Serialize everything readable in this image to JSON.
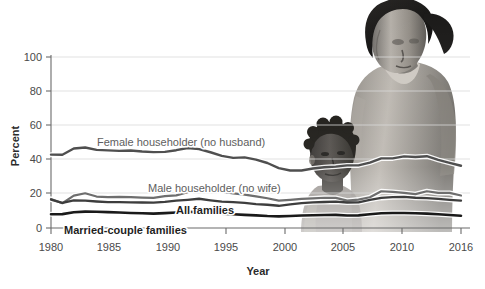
{
  "figure": {
    "background_color": "#ffffff",
    "photo": {
      "description": "grayscale photograph of a woman standing behind a child",
      "alt_name": "family-photograph"
    }
  },
  "chart_data": {
    "type": "line",
    "title": "",
    "xlabel": "Year",
    "ylabel": "Percent",
    "xlim": [
      1980,
      2016
    ],
    "ylim": [
      0,
      100
    ],
    "grid": true,
    "legend_position": "inline-labels",
    "xticks": [
      1980,
      1985,
      1990,
      1995,
      2000,
      2005,
      2010,
      2016
    ],
    "xtick_labels": [
      "1980",
      "1985",
      "1990",
      "1995",
      "2000",
      "2005",
      "2010",
      "2016"
    ],
    "yticks": [
      0,
      20,
      40,
      60,
      80,
      100
    ],
    "ytick_labels": [
      "0",
      "20",
      "40",
      "60",
      "80",
      "100"
    ],
    "x": [
      1980,
      1981,
      1982,
      1983,
      1984,
      1985,
      1986,
      1987,
      1988,
      1989,
      1990,
      1991,
      1992,
      1993,
      1994,
      1995,
      1996,
      1997,
      1998,
      1999,
      2000,
      2001,
      2002,
      2003,
      2004,
      2005,
      2006,
      2007,
      2008,
      2009,
      2010,
      2011,
      2012,
      2013,
      2014,
      2015,
      2016
    ],
    "series": [
      {
        "name": "Female householder (no husband)",
        "color": "#4f4f4f",
        "width": 2.4,
        "label_color": "#5e5e5e",
        "label_bold": false,
        "values": [
          42.9,
          42.8,
          46.5,
          47.1,
          45.7,
          45.4,
          45.1,
          45.3,
          44.7,
          44.4,
          44.5,
          45.5,
          46.8,
          46.1,
          44.3,
          42.2,
          41.0,
          41.3,
          40.0,
          38.0,
          35.0,
          33.6,
          33.6,
          34.8,
          35.5,
          35.9,
          36.6,
          36.6,
          38.2,
          40.7,
          40.7,
          41.9,
          41.5,
          42.0,
          39.8,
          38.1,
          36.4
        ]
      },
      {
        "name": "Male householder (no wife)",
        "color": "#6e6e6e",
        "width": 2.2,
        "label_color": "#6e6e6e",
        "label_bold": false,
        "values": [
          17.0,
          14.5,
          18.9,
          20.3,
          18.4,
          18.0,
          18.2,
          18.0,
          17.8,
          17.6,
          18.6,
          19.1,
          20.9,
          22.6,
          22.1,
          21.2,
          20.3,
          19.5,
          18.5,
          17.4,
          16.0,
          16.5,
          17.0,
          17.3,
          17.7,
          17.6,
          16.0,
          16.6,
          18.0,
          21.5,
          21.1,
          20.5,
          19.8,
          21.5,
          20.5,
          20.5,
          19.0
        ]
      },
      {
        "name": "All families",
        "color": "#3d3d3d",
        "width": 2.3,
        "label_color": "#1f1f1f",
        "label_bold": true,
        "values": [
          16.6,
          14.7,
          16.1,
          16.0,
          15.5,
          15.1,
          15.1,
          15.0,
          14.9,
          14.8,
          15.3,
          16.0,
          16.5,
          17.1,
          16.2,
          15.4,
          15.1,
          14.7,
          14.0,
          13.6,
          13.0,
          13.8,
          14.5,
          15.0,
          15.2,
          15.4,
          14.9,
          15.0,
          16.5,
          17.6,
          18.0,
          18.2,
          17.7,
          17.5,
          17.0,
          16.5,
          16.0
        ]
      },
      {
        "name": "Married-couple families",
        "color": "#1a1a1a",
        "width": 2.6,
        "label_color": "#1f1f1f",
        "label_bold": true,
        "values": [
          8.0,
          8.1,
          9.2,
          9.6,
          9.5,
          9.3,
          9.1,
          8.8,
          8.6,
          8.4,
          8.7,
          9.1,
          9.4,
          9.6,
          9.1,
          8.4,
          8.0,
          7.7,
          7.4,
          7.0,
          6.8,
          7.0,
          7.3,
          7.5,
          7.6,
          7.7,
          7.3,
          7.4,
          8.0,
          8.6,
          8.8,
          8.8,
          8.6,
          8.4,
          8.0,
          7.6,
          7.2
        ]
      }
    ],
    "annotations": [
      {
        "text": "Female householder (no husband)",
        "x_px": 97,
        "y_px": 146,
        "bold": false,
        "color": "#5e5e5e"
      },
      {
        "text": "Male householder (no wife)",
        "x_px": 148,
        "y_px": 192,
        "bold": false,
        "color": "#6e6e6e"
      },
      {
        "text": "All families",
        "x_px": 176,
        "y_px": 214,
        "bold": true,
        "color": "#1f1f1f"
      },
      {
        "text": "Married-couple families",
        "x_px": 64,
        "y_px": 234,
        "bold": true,
        "color": "#1f1f1f"
      }
    ]
  }
}
